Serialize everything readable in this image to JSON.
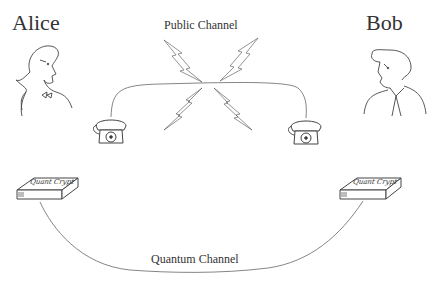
{
  "parties": {
    "alice": {
      "label": "Alice"
    },
    "bob": {
      "label": "Bob"
    }
  },
  "channels": {
    "public": {
      "label": "Public Channel"
    },
    "quantum": {
      "label": "Quantum Channel"
    }
  },
  "devices": {
    "alice_device": {
      "label": "Quant Crypt"
    },
    "bob_device": {
      "label": "Quant Crypt"
    }
  },
  "icons": [
    "person-alice-icon",
    "person-bob-icon",
    "telephone-icon",
    "lightning-bolt-icon",
    "crypto-box-icon"
  ],
  "colors": {
    "line": "#555555",
    "text": "#333333",
    "background": "#ffffff"
  }
}
